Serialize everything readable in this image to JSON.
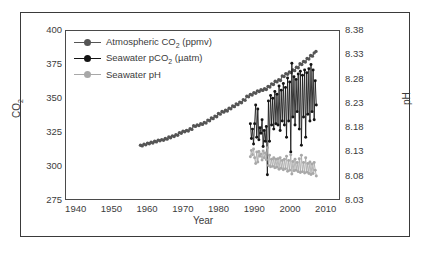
{
  "chart_data": {
    "type": "line",
    "title": "",
    "xlabel": "Year",
    "ylabel": "CO2",
    "ylabel_right": "pH",
    "xlim": [
      1937,
      2014
    ],
    "ylim": [
      275,
      400
    ],
    "ylim_right": [
      8.03,
      8.38
    ],
    "grid": false,
    "legend_position": "top-left",
    "xticks": [
      1940,
      1950,
      1960,
      1970,
      1980,
      1990,
      2000,
      2010
    ],
    "yticks_left": [
      275,
      300,
      325,
      350,
      375,
      400
    ],
    "yticks_right": [
      8.03,
      8.08,
      8.13,
      8.18,
      8.23,
      8.28,
      8.33,
      8.38
    ],
    "series": [
      {
        "name": "Atmospheric CO2 (ppmv)",
        "axis": "left",
        "color": "#555555",
        "marker": "circle",
        "x": [
          1958.0,
          1958.5,
          1959.0,
          1959.5,
          1960.0,
          1960.5,
          1961.0,
          1961.5,
          1962.0,
          1962.5,
          1963.0,
          1963.5,
          1964.0,
          1964.5,
          1965.0,
          1965.5,
          1966.0,
          1966.5,
          1967.0,
          1967.5,
          1968.0,
          1968.5,
          1969.0,
          1969.5,
          1970.0,
          1970.5,
          1971.0,
          1971.5,
          1972.0,
          1972.5,
          1973.0,
          1973.5,
          1974.0,
          1974.5,
          1975.0,
          1975.5,
          1976.0,
          1976.5,
          1977.0,
          1977.5,
          1978.0,
          1978.5,
          1979.0,
          1979.5,
          1980.0,
          1980.5,
          1981.0,
          1981.5,
          1982.0,
          1982.5,
          1983.0,
          1983.5,
          1984.0,
          1984.5,
          1985.0,
          1985.5,
          1986.0,
          1986.5,
          1987.0,
          1987.5,
          1988.0,
          1988.5,
          1989.0,
          1989.5,
          1990.0,
          1990.5,
          1991.0,
          1991.5,
          1992.0,
          1992.5,
          1993.0,
          1993.5,
          1994.0,
          1994.5,
          1995.0,
          1995.5,
          1996.0,
          1996.5,
          1997.0,
          1997.5,
          1998.0,
          1998.5,
          1999.0,
          1999.5,
          2000.0,
          2000.5,
          2001.0,
          2001.5,
          2002.0,
          2002.5,
          2003.0,
          2003.5,
          2004.0,
          2004.5,
          2005.0,
          2005.5,
          2006.0,
          2006.5,
          2007.0,
          2007.5
        ],
        "y": [
          315.0,
          314.5,
          315.8,
          315.3,
          316.6,
          316.1,
          317.2,
          316.7,
          318.0,
          317.5,
          318.8,
          318.3,
          319.2,
          318.7,
          320.0,
          319.5,
          321.1,
          320.6,
          322.0,
          321.5,
          322.9,
          322.4,
          324.4,
          323.9,
          325.5,
          325.0,
          326.1,
          325.6,
          327.3,
          326.8,
          329.5,
          329.0,
          330.1,
          329.6,
          331.0,
          330.5,
          332.0,
          331.5,
          333.7,
          333.2,
          335.3,
          334.8,
          336.7,
          336.2,
          338.6,
          338.1,
          340.1,
          339.6,
          341.0,
          340.5,
          342.6,
          342.1,
          344.2,
          343.7,
          345.7,
          345.2,
          347.1,
          346.6,
          348.9,
          348.4,
          351.5,
          351.0,
          352.9,
          352.4,
          354.2,
          353.7,
          355.5,
          355.0,
          356.3,
          355.8,
          357.0,
          356.5,
          358.8,
          358.3,
          360.7,
          360.2,
          362.6,
          362.1,
          363.7,
          363.2,
          366.6,
          366.1,
          368.3,
          367.8,
          369.5,
          369.0,
          371.0,
          370.5,
          373.1,
          372.6,
          375.6,
          375.1,
          377.4,
          376.9,
          379.6,
          379.1,
          381.8,
          381.3,
          383.7,
          384.8
        ]
      },
      {
        "name": "Seawater pCO2 (uatm)",
        "axis": "left",
        "color": "#141414",
        "marker": "circle",
        "x": [
          1989.0,
          1989.3,
          1989.6,
          1989.9,
          1990.2,
          1990.5,
          1990.8,
          1991.1,
          1991.4,
          1991.7,
          1992.0,
          1992.3,
          1992.6,
          1992.9,
          1993.2,
          1993.5,
          1993.8,
          1994.1,
          1994.4,
          1994.7,
          1995.0,
          1995.3,
          1995.6,
          1995.9,
          1996.2,
          1996.5,
          1996.8,
          1997.1,
          1997.4,
          1997.7,
          1998.0,
          1998.3,
          1998.6,
          1998.9,
          1999.2,
          1999.5,
          1999.8,
          2000.1,
          2000.4,
          2000.7,
          2001.0,
          2001.3,
          2001.6,
          2001.9,
          2002.2,
          2002.5,
          2002.8,
          2003.1,
          2003.4,
          2003.7,
          2004.0,
          2004.3,
          2004.6,
          2004.9,
          2005.2,
          2005.5,
          2005.8,
          2006.1,
          2006.4,
          2006.7,
          2007.0,
          2007.3,
          2007.6
        ],
        "y": [
          331,
          320,
          327,
          316,
          331,
          345,
          321,
          342,
          319,
          328,
          324,
          334,
          314,
          326,
          318,
          329,
          293,
          348,
          318,
          352,
          330,
          350,
          327,
          355,
          331,
          353,
          330,
          359,
          326,
          356,
          333,
          361,
          330,
          358,
          321,
          365,
          333,
          362,
          310,
          376,
          336,
          366,
          330,
          364,
          340,
          368,
          327,
          370,
          315,
          367,
          336,
          371,
          321,
          369,
          338,
          372,
          333,
          375,
          340,
          371,
          334,
          363,
          345
        ]
      },
      {
        "name": "Seawater pH",
        "axis": "right",
        "color": "#a8a8a8",
        "marker": "circle",
        "x": [
          1989.0,
          1989.3,
          1989.6,
          1989.9,
          1990.2,
          1990.5,
          1990.8,
          1991.1,
          1991.4,
          1991.7,
          1992.0,
          1992.3,
          1992.6,
          1992.9,
          1993.2,
          1993.5,
          1993.8,
          1994.1,
          1994.4,
          1994.7,
          1995.0,
          1995.3,
          1995.6,
          1995.9,
          1996.2,
          1996.5,
          1996.8,
          1997.1,
          1997.4,
          1997.7,
          1998.0,
          1998.3,
          1998.6,
          1998.9,
          1999.2,
          1999.5,
          1999.8,
          2000.1,
          2000.4,
          2000.7,
          2001.0,
          2001.3,
          2001.6,
          2001.9,
          2002.2,
          2002.5,
          2002.8,
          2003.1,
          2003.4,
          2003.7,
          2004.0,
          2004.3,
          2004.6,
          2004.9,
          2005.2,
          2005.5,
          2005.8,
          2006.1,
          2006.4,
          2006.7,
          2007.0,
          2007.3,
          2007.6
        ],
        "y": [
          8.118,
          8.131,
          8.122,
          8.134,
          8.116,
          8.104,
          8.128,
          8.107,
          8.129,
          8.119,
          8.124,
          8.111,
          8.13,
          8.116,
          8.126,
          8.112,
          8.137,
          8.1,
          8.121,
          8.097,
          8.113,
          8.098,
          8.116,
          8.095,
          8.113,
          8.096,
          8.114,
          8.092,
          8.116,
          8.094,
          8.11,
          8.091,
          8.113,
          8.093,
          8.119,
          8.088,
          8.11,
          8.09,
          8.122,
          8.082,
          8.108,
          8.089,
          8.113,
          8.09,
          8.106,
          8.087,
          8.114,
          8.085,
          8.121,
          8.087,
          8.106,
          8.084,
          8.116,
          8.086,
          8.104,
          8.083,
          8.107,
          8.081,
          8.103,
          8.083,
          8.106,
          8.09,
          8.078
        ]
      }
    ]
  },
  "legend": {
    "items": [
      {
        "label": "Atmospheric CO",
        "sub": "2",
        "suffix": " (ppmv)",
        "color": "#555555"
      },
      {
        "label": "Seawater pCO",
        "sub": "2",
        "suffix": " (µatm)",
        "color": "#141414"
      },
      {
        "label": "Seawater pH",
        "sub": "",
        "suffix": "",
        "color": "#a8a8a8"
      }
    ]
  },
  "axes": {
    "x_title": "Year",
    "y_left_title": "CO",
    "y_left_sub": "2",
    "y_right_title": "pH"
  }
}
